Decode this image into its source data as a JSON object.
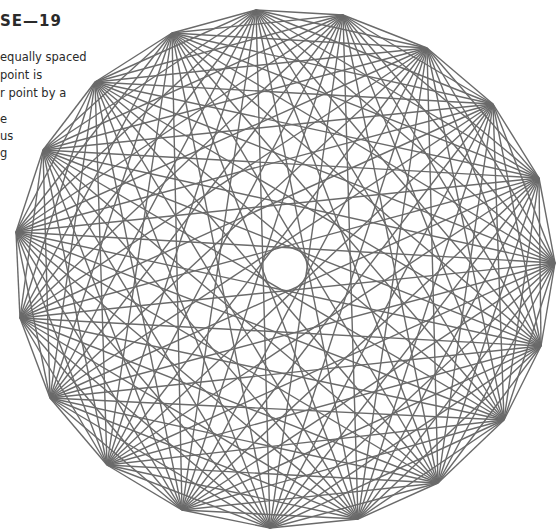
{
  "heading": "SE—19",
  "text_lines": [
    {
      "text": "equally spaced",
      "top": 50
    },
    {
      "text": "point is",
      "top": 68
    },
    {
      "text": "r point by a",
      "top": 86
    },
    {
      "text": "e",
      "top": 112
    },
    {
      "text": "us",
      "top": 129
    },
    {
      "text": "g",
      "top": 146
    }
  ],
  "diagram": {
    "type": "complete-graph",
    "vertex_count": 19,
    "line_color": "#6a6a6a",
    "line_width": 1.4,
    "vertices": [
      [
        256,
        10
      ],
      [
        343,
        15
      ],
      [
        427,
        48
      ],
      [
        493,
        104
      ],
      [
        539,
        178
      ],
      [
        555,
        263
      ],
      [
        541,
        346
      ],
      [
        504,
        420
      ],
      [
        438,
        483
      ],
      [
        358,
        519
      ],
      [
        270,
        528
      ],
      [
        182,
        510
      ],
      [
        107,
        465
      ],
      [
        50,
        398
      ],
      [
        20,
        318
      ],
      [
        16,
        232
      ],
      [
        43,
        150
      ],
      [
        95,
        82
      ],
      [
        172,
        33
      ]
    ]
  }
}
